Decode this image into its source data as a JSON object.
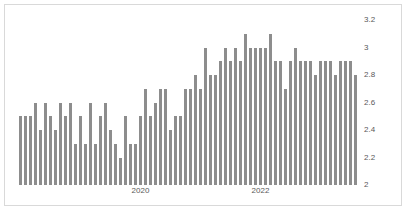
{
  "chart_data": {
    "type": "bar",
    "title": "",
    "subtitle": "",
    "xlabel": "",
    "ylabel": "",
    "ylim": [
      2,
      3.2
    ],
    "yticks": [
      "2",
      "2.2",
      "2.4",
      "2.6",
      "2.8",
      "3",
      "3.2"
    ],
    "ytick_values": [
      2,
      2.2,
      2.4,
      2.6,
      2.8,
      3,
      3.2
    ],
    "xticks": [
      "2020",
      "2022"
    ],
    "xtick_positions": [
      24,
      48
    ],
    "grid": false,
    "legend": null,
    "bar_color": "#8d8d8d",
    "categories": [
      "1",
      "2",
      "3",
      "4",
      "5",
      "6",
      "7",
      "8",
      "9",
      "10",
      "11",
      "12",
      "13",
      "14",
      "15",
      "16",
      "17",
      "18",
      "19",
      "20",
      "21",
      "22",
      "23",
      "24",
      "25",
      "26",
      "27",
      "28",
      "29",
      "30",
      "31",
      "32",
      "33",
      "34",
      "35",
      "36",
      "37",
      "38",
      "39",
      "40",
      "41",
      "42",
      "43",
      "44",
      "45",
      "46",
      "47",
      "48",
      "49",
      "50",
      "51",
      "52",
      "53",
      "54",
      "55",
      "56",
      "57",
      "58",
      "59",
      "60",
      "61",
      "62",
      "63",
      "64",
      "65",
      "66",
      "67",
      "68"
    ],
    "values": [
      2.5,
      2.5,
      2.5,
      2.6,
      2.4,
      2.6,
      2.5,
      2.4,
      2.6,
      2.5,
      2.6,
      2.3,
      2.5,
      2.3,
      2.6,
      2.3,
      2.5,
      2.6,
      2.4,
      2.3,
      2.2,
      2.5,
      2.3,
      2.3,
      2.5,
      2.7,
      2.5,
      2.6,
      2.7,
      2.7,
      2.4,
      2.5,
      2.5,
      2.7,
      2.7,
      2.8,
      2.7,
      3.0,
      2.8,
      2.8,
      2.9,
      3.0,
      2.9,
      3.0,
      2.9,
      3.1,
      3.0,
      3.0,
      3.0,
      3.0,
      3.1,
      2.9,
      2.9,
      2.7,
      2.9,
      3.0,
      2.9,
      2.9,
      2.9,
      2.8,
      2.9,
      2.9,
      2.9,
      2.8,
      2.9,
      2.9,
      2.9,
      2.8
    ]
  }
}
